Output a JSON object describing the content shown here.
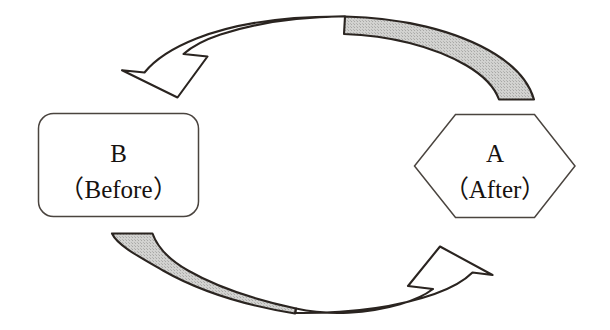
{
  "diagram": {
    "type": "cycle-diagram",
    "background_color": "#ffffff",
    "outline_color": "#2a2420",
    "shaded_fill_color": "#c8c8c8",
    "unshaded_fill_color": "#ffffff",
    "nodes": [
      {
        "id": "node-b",
        "shape": "rounded-rectangle",
        "label_main": "B",
        "label_sub": "（Before）",
        "fill": "#ffffff",
        "stroke": "#4a443f",
        "x": 38,
        "y": 113,
        "width": 161,
        "height": 104,
        "corner_radius": 15
      },
      {
        "id": "node-a",
        "shape": "hexagon",
        "label_main": "A",
        "label_sub": "（After）",
        "fill": "#ffffff",
        "stroke": "#4a443f",
        "x": 414,
        "y": 114,
        "width": 161,
        "height": 104
      }
    ],
    "arrows": [
      {
        "id": "arrow-top",
        "direction": "right-to-left",
        "from": "node-a",
        "to": "node-b",
        "head_position": "left",
        "head_fill": "#ffffff",
        "tail_position": "right",
        "tail_fill": "#c8c8c8",
        "stroke": "#2a2420"
      },
      {
        "id": "arrow-bottom",
        "direction": "left-to-right",
        "from": "node-b",
        "to": "node-a",
        "head_position": "right",
        "head_fill": "#ffffff",
        "tail_position": "left",
        "tail_fill": "#c8c8c8",
        "stroke": "#2a2420"
      }
    ]
  }
}
